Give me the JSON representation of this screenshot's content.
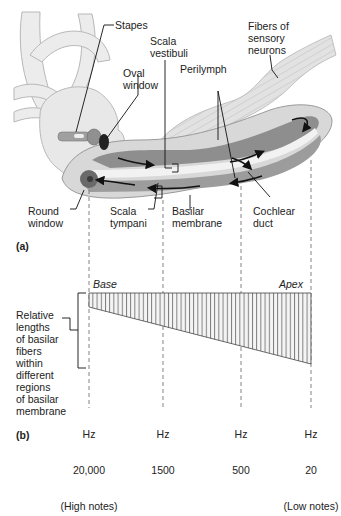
{
  "panel_a": {
    "tag": "(a)",
    "labels": {
      "stapes": "Stapes",
      "scala_vestibuli": "Scala\nvestibuli",
      "fibers": "Fibers of\nsensory\nneurons",
      "oval_window": "Oval\nwindow",
      "perilymph": "Perilymph",
      "round_window": "Round\nwindow",
      "scala_tympani": "Scala\ntympani",
      "basilar_membrane": "Basilar\nmembrane",
      "cochlear_duct": "Cochlear\nduct"
    }
  },
  "panel_b": {
    "tag": "(b)",
    "base_label": "Base",
    "apex_label": "Apex",
    "side_label": "Relative\nlengths\nof basilar\nfibers\nwithin\ndifferent\nregions\nof basilar\nmembrane",
    "frequency_markers": [
      {
        "unit": "Hz",
        "value": "20,000",
        "note": "(High notes)"
      },
      {
        "unit": "Hz",
        "value": "1500",
        "note": ""
      },
      {
        "unit": "Hz",
        "value": "500",
        "note": ""
      },
      {
        "unit": "Hz",
        "value": "20",
        "note": "(Low notes)"
      }
    ]
  },
  "colors": {
    "bone": "#e6e6e6",
    "bone_outline": "#b4b4b4",
    "canal_dark": "#8a8a8a",
    "canal_mid": "#a8a8a8",
    "duct_light": "#f2f2f2",
    "round_window": "#6a6a6a",
    "fibers": "#dcdcdc",
    "hatch": "#555555"
  }
}
